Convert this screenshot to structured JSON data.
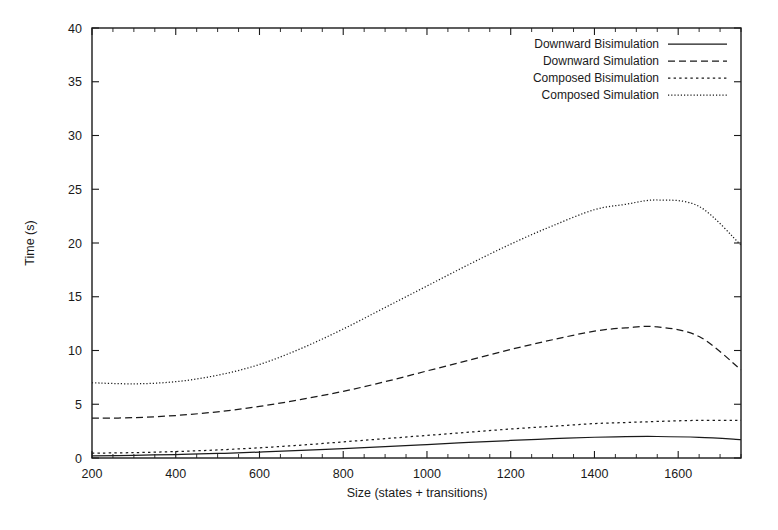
{
  "chart_data": {
    "type": "line",
    "title": "",
    "xlabel": "Size (states + transitions)",
    "ylabel": "Time (s)",
    "xlim": [
      200,
      1750
    ],
    "ylim": [
      0,
      40
    ],
    "xticks": [
      200,
      400,
      600,
      800,
      1000,
      1200,
      1400,
      1600
    ],
    "yticks": [
      0,
      5,
      10,
      15,
      20,
      25,
      30,
      35,
      40
    ],
    "grid": false,
    "legend_position": "top-right",
    "x": [
      200,
      300,
      400,
      500,
      600,
      700,
      800,
      900,
      1000,
      1100,
      1200,
      1300,
      1400,
      1475,
      1550,
      1650,
      1750
    ],
    "series": [
      {
        "name": "Downward Bisimulation",
        "style": "solid",
        "values": [
          0.2,
          0.25,
          0.32,
          0.42,
          0.55,
          0.7,
          0.88,
          1.05,
          1.25,
          1.45,
          1.63,
          1.8,
          1.93,
          1.99,
          2.0,
          1.92,
          1.72
        ]
      },
      {
        "name": "Downward Simulation",
        "style": "dashed",
        "values": [
          3.7,
          3.75,
          3.95,
          4.3,
          4.8,
          5.45,
          6.2,
          7.1,
          8.1,
          9.1,
          10.1,
          11.0,
          11.8,
          12.1,
          12.2,
          11.3,
          8.2
        ]
      },
      {
        "name": "Composed Bisimulation",
        "style": "dotted",
        "values": [
          0.45,
          0.5,
          0.6,
          0.75,
          0.95,
          1.2,
          1.5,
          1.8,
          2.1,
          2.4,
          2.7,
          2.95,
          3.2,
          3.3,
          3.4,
          3.5,
          3.5
        ]
      },
      {
        "name": "Composed Simulation",
        "style": "fine-dotted",
        "values": [
          7.0,
          6.9,
          7.1,
          7.7,
          8.7,
          10.2,
          12.0,
          14.0,
          16.0,
          18.0,
          19.9,
          21.6,
          23.1,
          23.6,
          24.0,
          23.4,
          19.8
        ]
      }
    ]
  },
  "legend": {
    "items": [
      {
        "label": "Downward Bisimulation",
        "style": "solid"
      },
      {
        "label": "Downward Simulation",
        "style": "dashed"
      },
      {
        "label": "Composed Bisimulation",
        "style": "dotted"
      },
      {
        "label": "Composed Simulation",
        "style": "fine-dotted"
      }
    ]
  },
  "colors": {
    "ink": "#1a1a1a",
    "background": "#ffffff"
  }
}
